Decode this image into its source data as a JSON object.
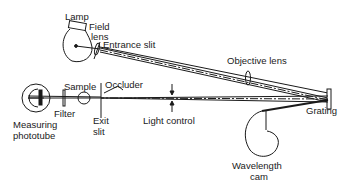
{
  "diagram": {
    "type": "optical-schematic",
    "labels": {
      "lamp": "Lamp",
      "field_lens_1": "Field",
      "field_lens_2": "lens",
      "entrance_slit": "Entrance slit",
      "objective_lens": "Objective lens",
      "sample": "Sample",
      "occluder": "Occluder",
      "filter": "Filter",
      "measuring_1": "Measuring",
      "measuring_2": "phototube",
      "exit_1": "Exit",
      "exit_2": "slit",
      "light_control": "Light control",
      "grating": "Grating",
      "wavelength_1": "Wavelength",
      "wavelength_2": "cam"
    },
    "components": [
      "lamp",
      "field-lens",
      "entrance-slit",
      "objective-lens",
      "grating",
      "wavelength-cam",
      "light-control",
      "occluder",
      "exit-slit",
      "sample",
      "filter",
      "measuring-phototube"
    ],
    "colors": {
      "ink": "#1a1a1a",
      "background": "#ffffff"
    }
  }
}
